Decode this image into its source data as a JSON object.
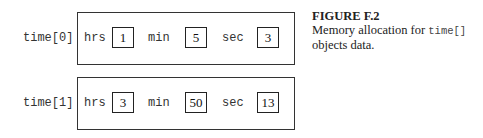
{
  "figure": {
    "number": "FIGURE F.2",
    "caption_before_code": "Memory allocation for ",
    "caption_code": "time[]",
    "caption_after_code": " objects data."
  },
  "objects": [
    {
      "label": "time[0]",
      "fields": [
        {
          "name": "hrs",
          "value": "1"
        },
        {
          "name": "min",
          "value": "5"
        },
        {
          "name": "sec",
          "value": "3"
        }
      ]
    },
    {
      "label": "time[1]",
      "fields": [
        {
          "name": "hrs",
          "value": "3"
        },
        {
          "name": "min",
          "value": "50"
        },
        {
          "name": "sec",
          "value": "13"
        }
      ]
    }
  ]
}
